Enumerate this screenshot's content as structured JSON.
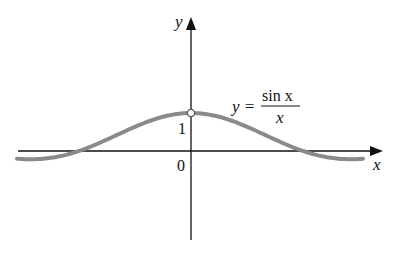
{
  "chart_data": {
    "type": "line",
    "title": "",
    "function": "y = sin x / x",
    "xlabel": "x",
    "ylabel": "y",
    "tick_labels": {
      "origin": "0",
      "y_one": "1"
    },
    "annotation": {
      "lhs": "y =",
      "numerator": "sin x",
      "denominator": "x"
    },
    "xlim": [
      -4.8,
      5.3
    ],
    "ylim": [
      -2.9,
      4.0
    ],
    "hole_point": {
      "x": 0,
      "y": 1,
      "style": "open-circle"
    },
    "series": [
      {
        "name": "sin x / x",
        "x": [
          -4.9,
          -4.0,
          -3.14,
          -2.5,
          -2.0,
          -1.5,
          -1.0,
          -0.5,
          0,
          0.5,
          1.0,
          1.5,
          2.0,
          2.5,
          3.14,
          4.0,
          4.8
        ],
        "values": [
          -0.2,
          -0.19,
          0.0,
          0.24,
          0.45,
          0.66,
          0.84,
          0.96,
          1.0,
          0.96,
          0.84,
          0.66,
          0.45,
          0.24,
          0.0,
          -0.19,
          -0.21
        ]
      }
    ],
    "colors": {
      "curve": "#8a8a8a",
      "axes": "#111111"
    },
    "grid": false,
    "legend": "none"
  }
}
